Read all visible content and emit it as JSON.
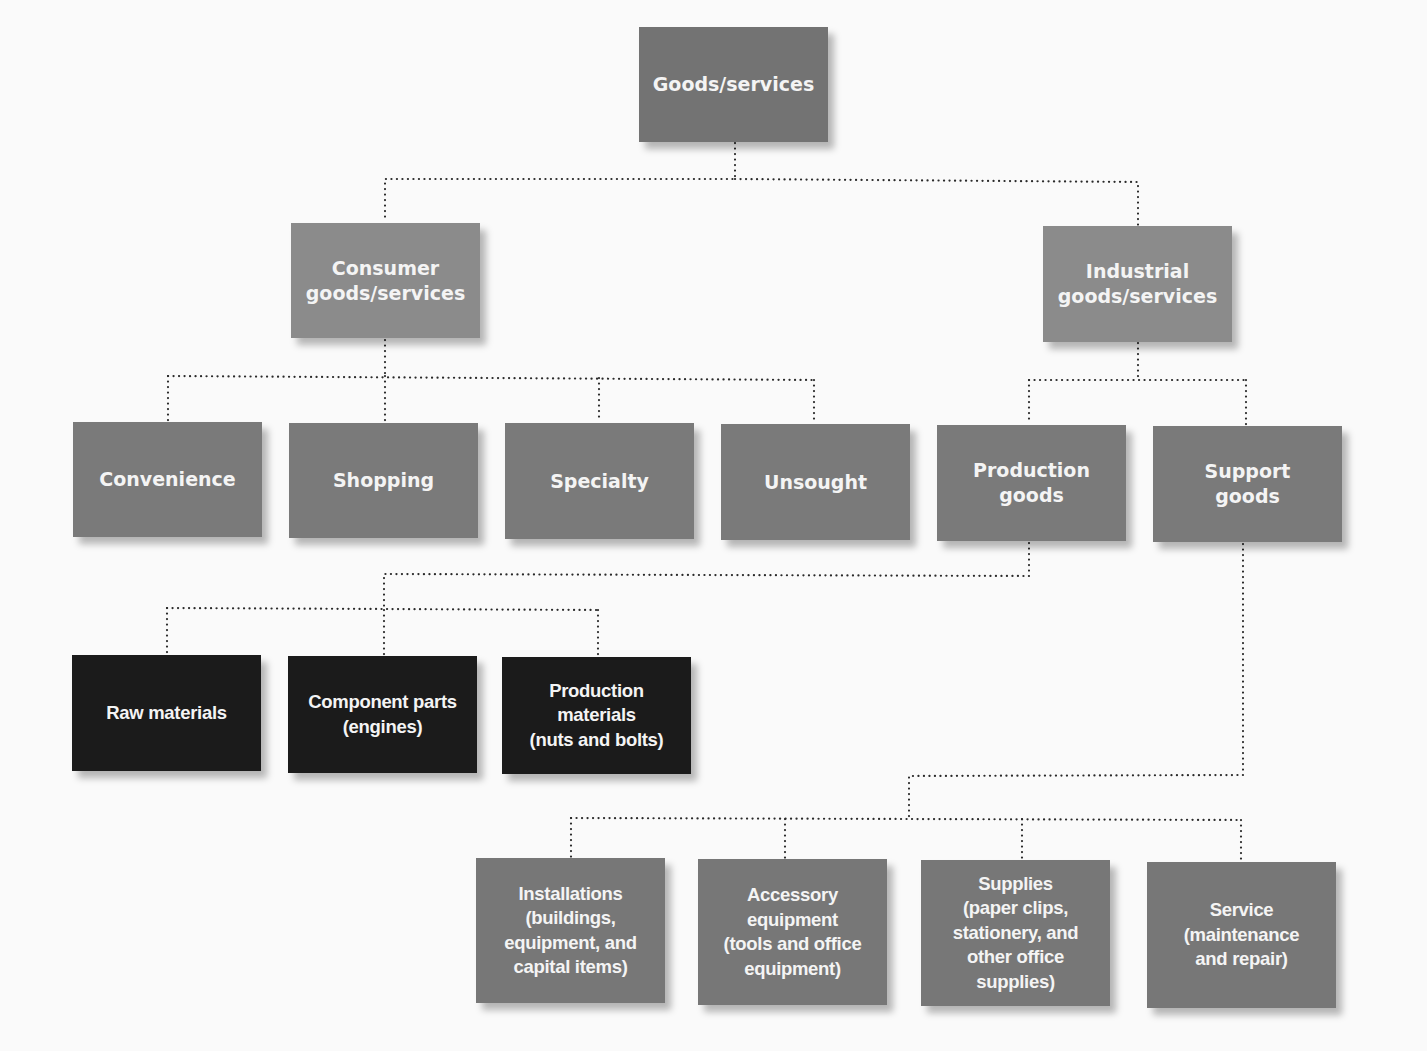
{
  "diagram": {
    "colors": {
      "root": "#737373",
      "level1": "#8b8b8b",
      "level2": "#7a7a7a",
      "production_children": "#1b1b1b",
      "support_children": "#777777",
      "text": "#f4f4f4",
      "connector": "#2a2a2a",
      "background": "#fafafa"
    },
    "nodes": [
      {
        "id": "goods-services",
        "label": "Goods/services",
        "x": 639,
        "y": 27,
        "w": 189,
        "h": 115,
        "color": "#737373"
      },
      {
        "id": "consumer",
        "label": "Consumer\ngoods/services",
        "x": 291,
        "y": 223,
        "w": 189,
        "h": 115,
        "color": "#8b8b8b"
      },
      {
        "id": "industrial",
        "label": "Industrial\ngoods/services",
        "x": 1043,
        "y": 226,
        "w": 189,
        "h": 116,
        "color": "#8b8b8b"
      },
      {
        "id": "convenience",
        "label": "Convenience",
        "x": 73,
        "y": 422,
        "w": 189,
        "h": 115,
        "color": "#7a7a7a"
      },
      {
        "id": "shopping",
        "label": "Shopping",
        "x": 289,
        "y": 423,
        "w": 189,
        "h": 115,
        "color": "#7a7a7a"
      },
      {
        "id": "specialty",
        "label": "Specialty",
        "x": 505,
        "y": 423,
        "w": 189,
        "h": 116,
        "color": "#7a7a7a"
      },
      {
        "id": "unsought",
        "label": "Unsought",
        "x": 721,
        "y": 424,
        "w": 189,
        "h": 116,
        "color": "#7a7a7a"
      },
      {
        "id": "production-goods",
        "label": "Production\ngoods",
        "x": 937,
        "y": 425,
        "w": 189,
        "h": 116,
        "color": "#7a7a7a"
      },
      {
        "id": "support-goods",
        "label": "Support\ngoods",
        "x": 1153,
        "y": 426,
        "w": 189,
        "h": 116,
        "color": "#7a7a7a"
      },
      {
        "id": "raw-materials",
        "label": "Raw materials",
        "x": 72,
        "y": 655,
        "w": 189,
        "h": 116,
        "color": "#1b1b1b",
        "narrow": true
      },
      {
        "id": "component-parts",
        "label": "Component parts\n(engines)",
        "x": 288,
        "y": 656,
        "w": 189,
        "h": 117,
        "color": "#1b1b1b",
        "narrow": true
      },
      {
        "id": "production-materials",
        "label": "Production\nmaterials\n(nuts and bolts)",
        "x": 502,
        "y": 657,
        "w": 189,
        "h": 117,
        "color": "#1b1b1b",
        "narrow": true
      },
      {
        "id": "installations",
        "label": "Installations\n(buildings,\nequipment, and\ncapital items)",
        "x": 476,
        "y": 858,
        "w": 189,
        "h": 145,
        "color": "#777777",
        "narrow": true
      },
      {
        "id": "accessory-equipment",
        "label": "Accessory\nequipment\n(tools and office\nequipment)",
        "x": 698,
        "y": 859,
        "w": 189,
        "h": 146,
        "color": "#777777",
        "narrow": true
      },
      {
        "id": "supplies",
        "label": "Supplies\n(paper clips,\nstationery, and\nother office\nsupplies)",
        "x": 921,
        "y": 860,
        "w": 189,
        "h": 146,
        "color": "#777777",
        "narrow": true
      },
      {
        "id": "service",
        "label": "Service\n(maintenance\nand repair)",
        "x": 1147,
        "y": 862,
        "w": 189,
        "h": 146,
        "color": "#777777",
        "narrow": true
      }
    ],
    "connectors": [
      {
        "from": "goods-services",
        "to": [
          "consumer",
          "industrial"
        ],
        "points": [
          [
            735,
            143
          ],
          [
            735,
            179
          ],
          [
            385,
            179
          ],
          [
            385,
            222
          ]
        ],
        "points2": [
          [
            735,
            179
          ],
          [
            1138,
            182
          ],
          [
            1138,
            225
          ]
        ]
      },
      {
        "path": [
          [
            385,
            340
          ],
          [
            385,
            376
          ]
        ]
      },
      {
        "path": [
          [
            168,
            376
          ],
          [
            814,
            380
          ]
        ]
      },
      {
        "path": [
          [
            168,
            376
          ],
          [
            168,
            421
          ]
        ]
      },
      {
        "path": [
          [
            385,
            376
          ],
          [
            385,
            422
          ]
        ]
      },
      {
        "path": [
          [
            599,
            378
          ],
          [
            599,
            422
          ]
        ]
      },
      {
        "path": [
          [
            814,
            380
          ],
          [
            814,
            423
          ]
        ]
      },
      {
        "path": [
          [
            1138,
            343
          ],
          [
            1138,
            380
          ]
        ]
      },
      {
        "path": [
          [
            1029,
            380
          ],
          [
            1246,
            380
          ]
        ]
      },
      {
        "path": [
          [
            1029,
            380
          ],
          [
            1029,
            424
          ]
        ]
      },
      {
        "path": [
          [
            1246,
            380
          ],
          [
            1246,
            425
          ]
        ]
      },
      {
        "path": [
          [
            1029,
            543
          ],
          [
            1029,
            576
          ],
          [
            384,
            574
          ],
          [
            384,
            610
          ]
        ]
      },
      {
        "path": [
          [
            167,
            608
          ],
          [
            598,
            610
          ]
        ]
      },
      {
        "path": [
          [
            167,
            608
          ],
          [
            167,
            654
          ]
        ]
      },
      {
        "path": [
          [
            384,
            610
          ],
          [
            384,
            655
          ]
        ]
      },
      {
        "path": [
          [
            598,
            610
          ],
          [
            598,
            656
          ]
        ]
      },
      {
        "path": [
          [
            1243,
            544
          ],
          [
            1243,
            775
          ],
          [
            909,
            776
          ],
          [
            909,
            818
          ]
        ]
      },
      {
        "path": [
          [
            571,
            818
          ],
          [
            1241,
            820
          ]
        ]
      },
      {
        "path": [
          [
            571,
            818
          ],
          [
            571,
            857
          ]
        ]
      },
      {
        "path": [
          [
            785,
            819
          ],
          [
            785,
            858
          ]
        ]
      },
      {
        "path": [
          [
            1022,
            819
          ],
          [
            1022,
            859
          ]
        ]
      },
      {
        "path": [
          [
            1241,
            820
          ],
          [
            1241,
            861
          ]
        ]
      }
    ]
  }
}
